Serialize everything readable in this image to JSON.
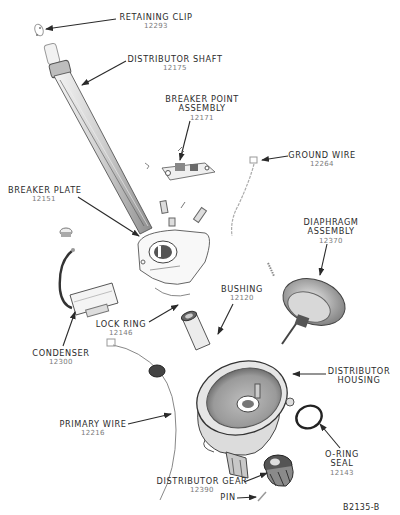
{
  "figure": {
    "id": "B2135-B",
    "type": "exploded parts view"
  },
  "parts": [
    {
      "key": "retaining_clip",
      "name": "RETAINING CLIP",
      "number": "12293"
    },
    {
      "key": "distributor_shaft",
      "name": "DISTRIBUTOR SHAFT",
      "number": "12175"
    },
    {
      "key": "breaker_point_assembly",
      "name_lines": [
        "BREAKER POINT",
        "ASSEMBLY"
      ],
      "number": "12171"
    },
    {
      "key": "ground_wire",
      "name": "GROUND WIRE",
      "number": "12264"
    },
    {
      "key": "breaker_plate",
      "name": "BREAKER PLATE",
      "number": "12151"
    },
    {
      "key": "diaphragm_assembly",
      "name_lines": [
        "DIAPHRAGM",
        "ASSEMBLY"
      ],
      "number": "12370"
    },
    {
      "key": "bushing",
      "name": "BUSHING",
      "number": "12120"
    },
    {
      "key": "lock_ring",
      "name": "LOCK RING",
      "number": "12146"
    },
    {
      "key": "condenser",
      "name": "CONDENSER",
      "number": "12300"
    },
    {
      "key": "distributor_housing",
      "name_lines": [
        "DISTRIBUTOR",
        "HOUSING"
      ],
      "number": ""
    },
    {
      "key": "primary_wire",
      "name": "PRIMARY WIRE",
      "number": "12216"
    },
    {
      "key": "o_ring_seal",
      "name_lines": [
        "O-RING",
        "SEAL"
      ],
      "number": "12143"
    },
    {
      "key": "distributor_gear",
      "name": "DISTRIBUTOR GEAR",
      "number": "12390"
    },
    {
      "key": "pin",
      "name": "PIN",
      "number": ""
    }
  ],
  "labels": {
    "retaining_clip": {
      "name": "RETAINING CLIP",
      "number": "12293"
    },
    "distributor_shaft": {
      "name": "DISTRIBUTOR SHAFT",
      "number": "12175"
    },
    "breaker_point_assembly": {
      "line1": "BREAKER POINT",
      "line2": "ASSEMBLY",
      "number": "12171"
    },
    "ground_wire": {
      "name": "GROUND WIRE",
      "number": "12264"
    },
    "breaker_plate": {
      "name": "BREAKER PLATE",
      "number": "12151"
    },
    "diaphragm_assembly": {
      "line1": "DIAPHRAGM",
      "line2": "ASSEMBLY",
      "number": "12370"
    },
    "bushing": {
      "name": "BUSHING",
      "number": "12120"
    },
    "lock_ring": {
      "name": "LOCK RING",
      "number": "12146"
    },
    "condenser": {
      "name": "CONDENSER",
      "number": "12300"
    },
    "distributor_housing": {
      "line1": "DISTRIBUTOR",
      "line2": "HOUSING"
    },
    "primary_wire": {
      "name": "PRIMARY WIRE",
      "number": "12216"
    },
    "o_ring_seal": {
      "line1": "O-RING",
      "line2": "SEAL",
      "number": "12143"
    },
    "distributor_gear": {
      "name": "DISTRIBUTOR GEAR",
      "number": "12390"
    },
    "pin": {
      "name": "PIN"
    }
  },
  "colors": {
    "background": "#ffffff",
    "line_art": "#3a3a3a",
    "label_text": "#2b2b2b",
    "part_number_text": "#7a7a7a",
    "shading": "#9a9a9a"
  }
}
